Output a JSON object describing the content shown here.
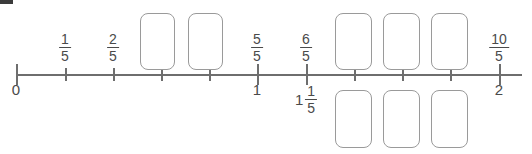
{
  "worksheet": {
    "title": "Fraction number line with answer boxes",
    "background_color": "#ffffff",
    "line_color": "#6e6e6e",
    "text_color": "#4a4a4a",
    "box_border_color": "#9a9a9a"
  },
  "numberline": {
    "start_value": "0",
    "end_value": "2",
    "denominator": "5",
    "tick_count": 11,
    "ticks": [
      {
        "x": 16,
        "kind": "major",
        "above_label": "",
        "below_label": "0"
      },
      {
        "x": 65,
        "kind": "minor",
        "above_label": "1/5",
        "below_label": ""
      },
      {
        "x": 113,
        "kind": "minor",
        "above_label": "2/5",
        "below_label": ""
      },
      {
        "x": 161,
        "kind": "minor",
        "above_label": "",
        "below_label": ""
      },
      {
        "x": 209,
        "kind": "minor",
        "above_label": "",
        "below_label": ""
      },
      {
        "x": 257,
        "kind": "major",
        "above_label": "5/5",
        "below_label": "1"
      },
      {
        "x": 306,
        "kind": "major",
        "above_label": "6/5",
        "below_label": "1 1/5"
      },
      {
        "x": 354,
        "kind": "minor",
        "above_label": "",
        "below_label": ""
      },
      {
        "x": 402,
        "kind": "minor",
        "above_label": "",
        "below_label": ""
      },
      {
        "x": 450,
        "kind": "minor",
        "above_label": "",
        "below_label": ""
      },
      {
        "x": 499,
        "kind": "major",
        "above_label": "10/5",
        "below_label": "2"
      }
    ]
  },
  "labels_above": [
    {
      "name": "label-one-fifth",
      "x": 65,
      "numerator": "1",
      "denominator": "5"
    },
    {
      "name": "label-two-fifths",
      "x": 113,
      "numerator": "2",
      "denominator": "5"
    },
    {
      "name": "label-five-fifths",
      "x": 257,
      "numerator": "5",
      "denominator": "5"
    },
    {
      "name": "label-six-fifths",
      "x": 306,
      "numerator": "6",
      "denominator": "5"
    },
    {
      "name": "label-ten-fifths",
      "x": 499,
      "numerator": "10",
      "denominator": "5"
    }
  ],
  "labels_below": [
    {
      "name": "label-zero",
      "x": 16,
      "text": "0"
    },
    {
      "name": "label-one",
      "x": 257,
      "text": "1"
    },
    {
      "name": "label-two",
      "x": 499,
      "text": "2"
    }
  ],
  "mixed_label_below": {
    "name": "label-one-and-one-fifth",
    "x": 306,
    "whole": "1",
    "numerator": "1",
    "denominator": "5"
  },
  "answer_boxes": [
    {
      "name": "answer-box-3-5",
      "row": "above",
      "x": 140,
      "y": 13,
      "w": 35,
      "h": 57,
      "value": ""
    },
    {
      "name": "answer-box-4-5",
      "row": "above",
      "x": 188,
      "y": 13,
      "w": 35,
      "h": 57,
      "value": ""
    },
    {
      "name": "answer-box-7-5",
      "row": "above",
      "x": 335,
      "y": 13,
      "w": 37,
      "h": 57,
      "value": ""
    },
    {
      "name": "answer-box-8-5",
      "row": "above",
      "x": 383,
      "y": 13,
      "w": 37,
      "h": 57,
      "value": ""
    },
    {
      "name": "answer-box-9-5",
      "row": "above",
      "x": 431,
      "y": 13,
      "w": 37,
      "h": 57,
      "value": ""
    },
    {
      "name": "answer-box-1-2-5",
      "row": "below",
      "x": 335,
      "y": 90,
      "w": 37,
      "h": 58,
      "value": ""
    },
    {
      "name": "answer-box-1-3-5",
      "row": "below",
      "x": 383,
      "y": 90,
      "w": 37,
      "h": 58,
      "value": ""
    },
    {
      "name": "answer-box-1-4-5",
      "row": "below",
      "x": 431,
      "y": 90,
      "w": 37,
      "h": 58,
      "value": ""
    }
  ]
}
